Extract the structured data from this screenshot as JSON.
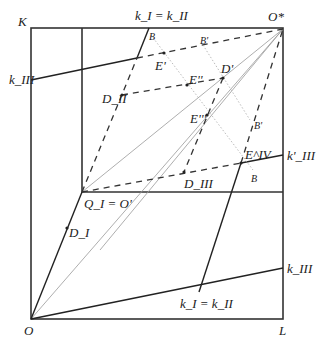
{
  "diagram": {
    "corners": {
      "origin": "O",
      "top_left": "K",
      "bottom_right": "L",
      "top_right": "O*"
    },
    "inner_origin": "Q_I = O'",
    "labels": {
      "k_top": "k_I = k_II",
      "k_bottom": "k_I = k_II",
      "k_III_left": "k_III",
      "k_III_right": "k_III",
      "k_III_prime": "k'_III",
      "D_I": "D_I",
      "D_II": "D_II",
      "D_III": "D_III",
      "D_prime": "D'",
      "E_prime": "E'",
      "E_double": "E''",
      "E_triple": "E'''",
      "E_IV": "E^IV",
      "B_top": "B",
      "B_prime_top": "B'",
      "B_prime_right": "B'",
      "B_bottom": "B"
    }
  }
}
